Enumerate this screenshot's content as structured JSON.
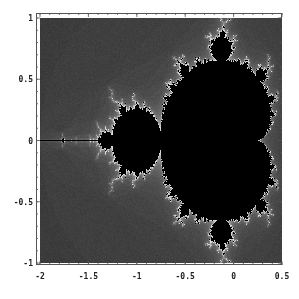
{
  "chart_data": {
    "type": "heatmap",
    "title": "",
    "subtitle": "",
    "xlabel": "",
    "ylabel": "",
    "xlim": [
      -2,
      0.5
    ],
    "ylim": [
      -1,
      1
    ],
    "x_ticks": [
      -2,
      -1.5,
      -1,
      -0.5,
      0,
      0.5
    ],
    "x_tick_labels": [
      "-2",
      "-1.5",
      "-1",
      "-0.5",
      "0",
      "0.5"
    ],
    "y_ticks": [
      1,
      0.5,
      0,
      -0.5,
      -1
    ],
    "y_tick_labels": [
      "1",
      "0.5",
      "0",
      "-0.5",
      "-1"
    ],
    "grid": false,
    "legend": null,
    "colors": {
      "interior": "#000000",
      "exterior": "#3a3a3a",
      "boundary": "#d8d8d8",
      "frame": "#555555",
      "background": "#ffffff"
    },
    "max_iterations": 40
  }
}
